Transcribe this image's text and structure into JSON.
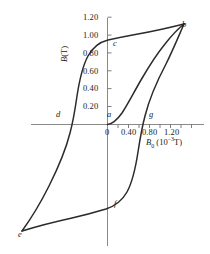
{
  "figure": {
    "kind": "hysteresis-loop",
    "background_color": "#ffffff",
    "curve_color": "#2b2b2b",
    "axis_color": "#7a7a7a"
  },
  "axes": {
    "y": {
      "title_html": "<i>B</i>(T)",
      "title_text": "B(T)",
      "unit": "T",
      "ticks": [
        "1.20",
        "1.00",
        "0.80",
        "0.60",
        "0.40",
        "0.20"
      ],
      "tick_values": [
        1.2,
        1.0,
        0.8,
        0.6,
        0.4,
        0.2
      ],
      "range": [
        -1.25,
        1.3
      ]
    },
    "x": {
      "title_html": "<i>B</i><sub>0</sub> (10<sup>&#8722;3</sup>T)",
      "title_text": "B0 (10-3 T)",
      "unit": "10^-3 T",
      "origin_label": "0",
      "ticks": [
        "0.40",
        "0.80",
        "1.20"
      ],
      "tick_values": [
        0.4,
        0.8,
        1.2
      ],
      "minor_tick_step": 0.2,
      "range": [
        -1.45,
        1.45
      ]
    }
  },
  "points": [
    {
      "id": "a",
      "label": "a",
      "x": 0.0,
      "y": 0.0,
      "lx": 107,
      "ly": 110
    },
    {
      "id": "b",
      "label": "b",
      "x": 1.28,
      "y": 1.06,
      "lx": 182,
      "ly": 20
    },
    {
      "id": "c",
      "label": "c",
      "x": 0.0,
      "y": 0.95,
      "lx": 113,
      "ly": 39
    },
    {
      "id": "d",
      "label": "d",
      "x": -0.7,
      "y": 0.0,
      "lx": 56,
      "ly": 110
    },
    {
      "id": "e",
      "label": "e",
      "x": -1.28,
      "y": -1.06,
      "lx": 18,
      "ly": 230
    },
    {
      "id": "f",
      "label": "f",
      "x": 0.0,
      "y": -0.95,
      "lx": 114,
      "ly": 199
    },
    {
      "id": "g",
      "label": "g",
      "x": 0.7,
      "y": 0.0,
      "lx": 149,
      "ly": 110
    }
  ],
  "chart_data": {
    "type": "line",
    "title": "",
    "xlabel": "B0 (10^-3 T)",
    "ylabel": "B (T)",
    "xlim": [
      -1.45,
      1.45
    ],
    "ylim": [
      -1.25,
      1.3
    ],
    "grid": false,
    "legend": null,
    "annotations": [
      "a",
      "b",
      "c",
      "d",
      "e",
      "f",
      "g"
    ],
    "series": [
      {
        "name": "initial-magnetization-curve",
        "description": "virgin curve from origin a up to saturation b",
        "x": [
          0.0,
          0.1,
          0.2,
          0.3,
          0.4,
          0.5,
          0.6,
          0.7,
          0.8,
          0.9,
          1.0,
          1.1,
          1.2,
          1.28
        ],
        "y": [
          0.0,
          0.04,
          0.11,
          0.22,
          0.36,
          0.51,
          0.65,
          0.77,
          0.86,
          0.93,
          0.98,
          1.02,
          1.05,
          1.06
        ]
      },
      {
        "name": "descending-branch",
        "description": "b to c to d to e (saturation down through remanence and coercivity)",
        "x": [
          1.28,
          1.1,
          0.9,
          0.7,
          0.5,
          0.3,
          0.1,
          0.0,
          -0.15,
          -0.3,
          -0.45,
          -0.55,
          -0.62,
          -0.7,
          -0.78,
          -0.88,
          -1.0,
          -1.12,
          -1.28
        ],
        "y": [
          1.06,
          1.03,
          1.0,
          0.97,
          0.95,
          0.93,
          0.9,
          0.88,
          0.82,
          0.72,
          0.55,
          0.38,
          0.22,
          0.0,
          -0.26,
          -0.52,
          -0.75,
          -0.93,
          -1.06
        ]
      },
      {
        "name": "ascending-branch",
        "description": "e to f to g back up to b (return through remanence and coercivity)",
        "x": [
          -1.28,
          -1.12,
          -1.0,
          -0.85,
          -0.65,
          -0.45,
          -0.25,
          -0.1,
          0.0,
          0.15,
          0.3,
          0.45,
          0.55,
          0.62,
          0.7,
          0.8,
          0.92,
          1.05,
          1.18,
          1.28
        ],
        "y": [
          -1.06,
          -1.04,
          -1.02,
          -1.0,
          -0.98,
          -0.96,
          -0.94,
          -0.92,
          -0.9,
          -0.85,
          -0.76,
          -0.6,
          -0.44,
          -0.26,
          0.0,
          0.34,
          0.63,
          0.84,
          0.98,
          1.06
        ]
      }
    ]
  }
}
